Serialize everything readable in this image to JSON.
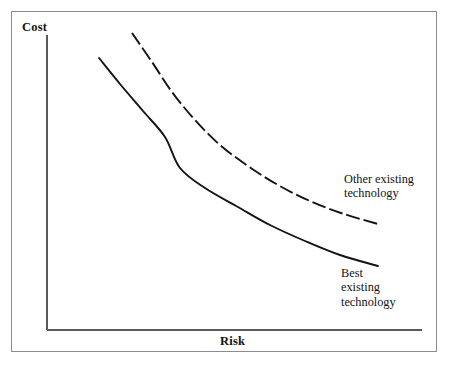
{
  "figure": {
    "width": 449,
    "height": 366,
    "background": "#ffffff",
    "frame_color": "#8c8c8c",
    "ink_color": "#141414"
  },
  "chart_data": {
    "type": "line",
    "title": "",
    "subtitle": "",
    "xlabel": "Risk",
    "ylabel": "Cost",
    "xlim": [
      0,
      1
    ],
    "ylim": [
      0,
      1
    ],
    "grid": false,
    "tick_labels": {
      "x": [],
      "y": []
    },
    "legend_position": "inline-annotations",
    "axes": {
      "x_axis": {
        "x_start": 47,
        "x_end": 422,
        "y": 330
      },
      "y_axis": {
        "y_start": 35,
        "y_end": 330,
        "x": 47
      }
    },
    "series": [
      {
        "name": "Best existing technology",
        "style": "solid",
        "color": "#141414",
        "annotation": "Best\nexisting\ntechnology",
        "points": [
          {
            "x": 99,
            "y": 58
          },
          {
            "x": 120,
            "y": 84
          },
          {
            "x": 143,
            "y": 111
          },
          {
            "x": 165,
            "y": 137
          },
          {
            "x": 180,
            "y": 168
          },
          {
            "x": 205,
            "y": 188
          },
          {
            "x": 238,
            "y": 207
          },
          {
            "x": 270,
            "y": 225
          },
          {
            "x": 305,
            "y": 241
          },
          {
            "x": 340,
            "y": 255
          },
          {
            "x": 378,
            "y": 266
          }
        ]
      },
      {
        "name": "Other existing technology",
        "style": "dashed",
        "dash_pattern": "14 4",
        "color": "#141414",
        "annotation": "Other existing\ntechnology",
        "points": [
          {
            "x": 132,
            "y": 33
          },
          {
            "x": 152,
            "y": 62
          },
          {
            "x": 172,
            "y": 92
          },
          {
            "x": 195,
            "y": 120
          },
          {
            "x": 220,
            "y": 145
          },
          {
            "x": 248,
            "y": 166
          },
          {
            "x": 278,
            "y": 185
          },
          {
            "x": 310,
            "y": 201
          },
          {
            "x": 344,
            "y": 214
          },
          {
            "x": 378,
            "y": 224
          }
        ]
      }
    ]
  },
  "labels": {
    "y_axis_title": "Cost",
    "x_axis_title": "Risk",
    "other_technology_line1": "Other existing",
    "other_technology_line2": "technology",
    "best_technology_line1": "Best",
    "best_technology_line2": "existing",
    "best_technology_line3": "technology"
  }
}
